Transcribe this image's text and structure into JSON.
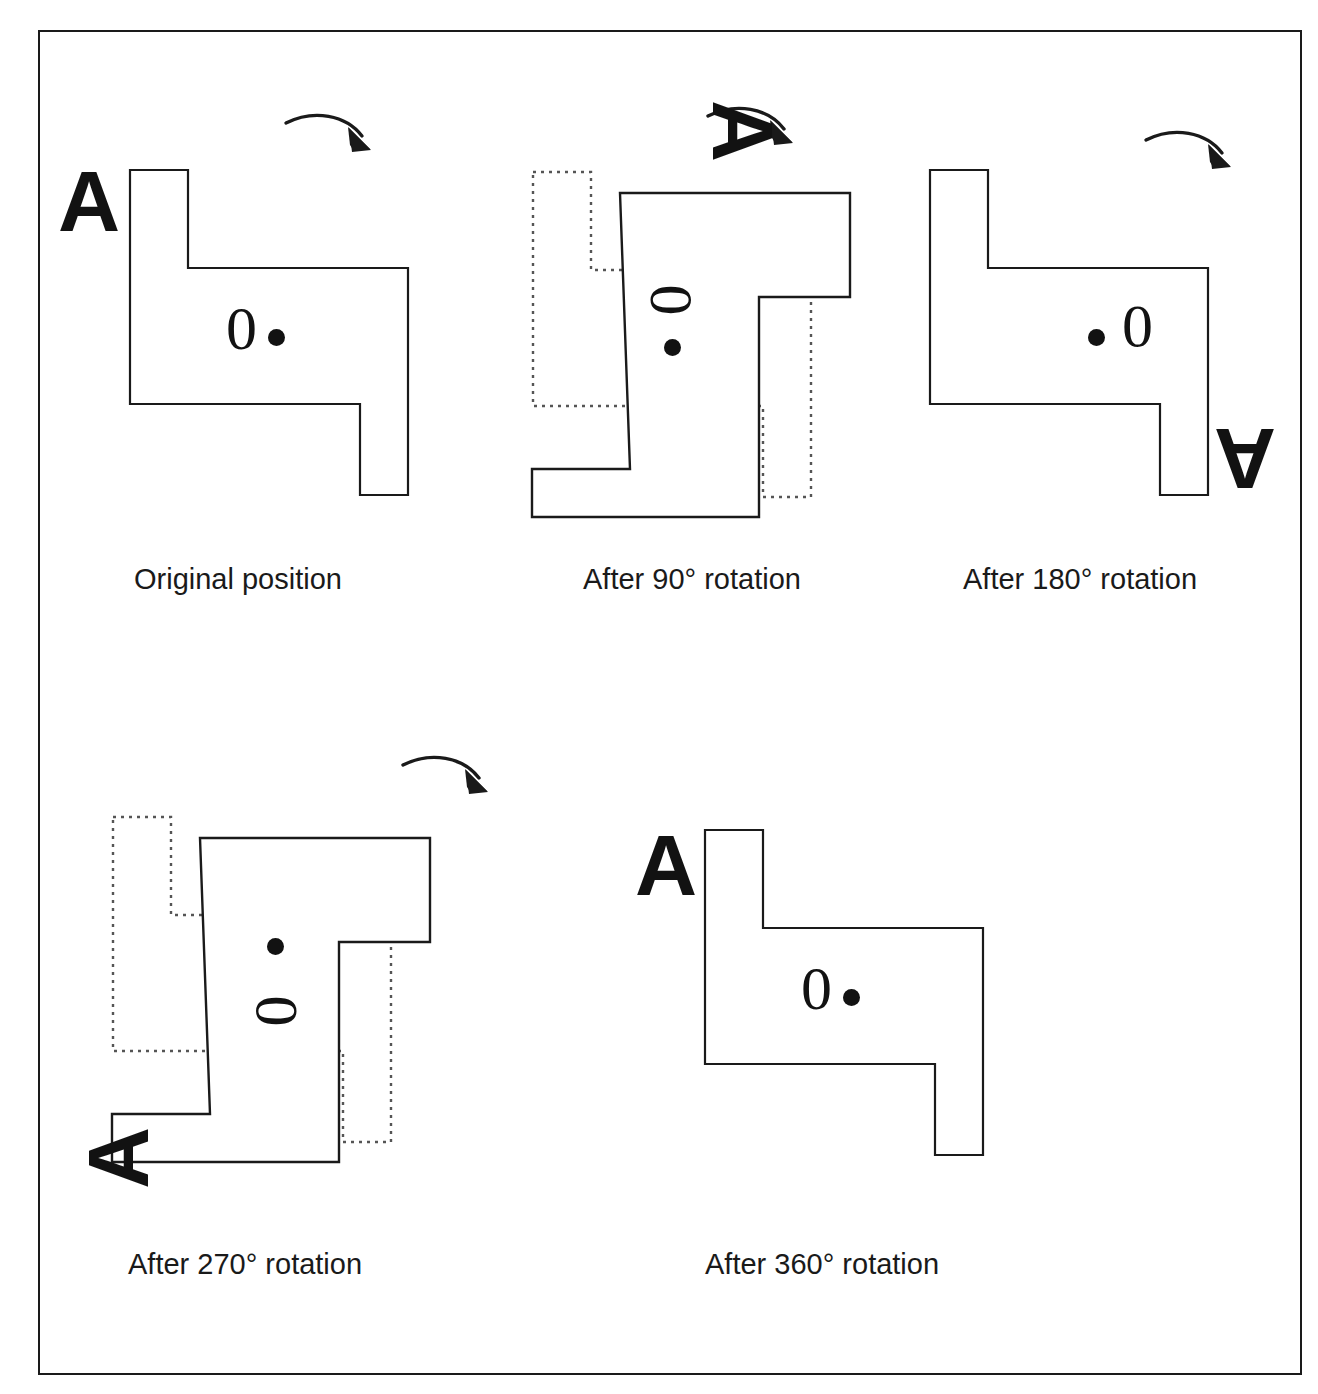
{
  "figure": {
    "kind": "rotation-sequence-diagram",
    "orientation_marker_letter": "A",
    "center_marker_digit": "0",
    "center_marker_dot": "dot",
    "rotation_direction": "clockwise",
    "border_color": "#1a1a1a",
    "shape_stroke_color": "#1a1a1a",
    "ghost_stroke_color": "#555555",
    "ink_color": "#121212",
    "background_color": "#ffffff"
  },
  "panels": [
    {
      "id": "original",
      "caption": "Original position",
      "rotation_degrees": 0,
      "has_ghost_outline": false,
      "has_arrow": true,
      "letter": "A",
      "digit": "0"
    },
    {
      "id": "rot90",
      "caption": "After 90° rotation",
      "rotation_degrees": 90,
      "has_ghost_outline": true,
      "has_arrow": true,
      "letter": "A",
      "digit": "0"
    },
    {
      "id": "rot180",
      "caption": "After 180° rotation",
      "rotation_degrees": 180,
      "has_ghost_outline": false,
      "has_arrow": true,
      "letter": "A",
      "digit": "0"
    },
    {
      "id": "rot270",
      "caption": "After 270° rotation",
      "rotation_degrees": 270,
      "has_ghost_outline": true,
      "has_arrow": true,
      "letter": "A",
      "digit": "0"
    },
    {
      "id": "rot360",
      "caption": "After 360° rotation",
      "rotation_degrees": 360,
      "has_ghost_outline": false,
      "has_arrow": false,
      "letter": "A",
      "digit": "0"
    }
  ],
  "shape": {
    "description": "Z-shaped / stepped hexomino outline with 180-degree rotational symmetry",
    "polygon_points": "0,0 58,0 58,98 278,98 278,325 230,325 230,234 0,234"
  }
}
